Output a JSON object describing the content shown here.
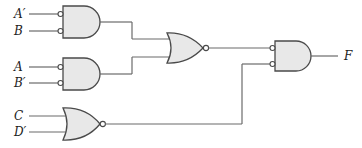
{
  "diagram": {
    "type": "logic-circuit",
    "inputs": {
      "a_prime": "A′",
      "b": "B",
      "a": "A",
      "b_prime": "B′",
      "c": "C",
      "d_prime": "D′"
    },
    "output": "F",
    "gates": [
      {
        "id": "g1",
        "kind": "AND",
        "inverted_inputs": true,
        "inputs": [
          "A′",
          "B"
        ]
      },
      {
        "id": "g2",
        "kind": "AND",
        "inverted_inputs": true,
        "inputs": [
          "A",
          "B′"
        ]
      },
      {
        "id": "g3",
        "kind": "NOR",
        "inputs": [
          "g1",
          "g2"
        ]
      },
      {
        "id": "g4",
        "kind": "NOR",
        "inputs": [
          "C",
          "D′"
        ]
      },
      {
        "id": "g5",
        "kind": "AND",
        "inverted_inputs": true,
        "inputs": [
          "g3",
          "g4"
        ],
        "output": "F"
      }
    ]
  }
}
